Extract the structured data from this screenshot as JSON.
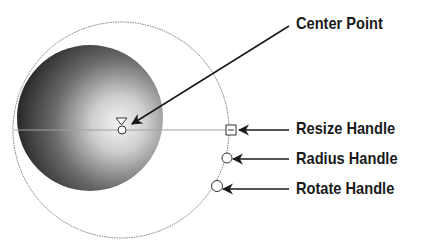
{
  "diagram": {
    "labels": {
      "center_point": "Center Point",
      "resize_handle": "Resize Handle",
      "radius_handle": "Radius Handle",
      "rotate_handle": "Rotate Handle"
    },
    "colors": {
      "background": "#ffffff",
      "text": "#1a1a1a",
      "outline": "#777777",
      "sphere_dark": "#1e1e1e",
      "sphere_light": "#f2f2f2",
      "arrow": "#1a1a1a"
    }
  }
}
